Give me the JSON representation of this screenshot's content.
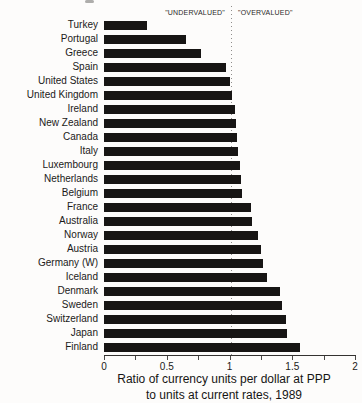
{
  "annotations": {
    "undervalued": "\"UNDERVALUED\"",
    "overvalued": "\"OVERVALUED\""
  },
  "chart_data": {
    "type": "bar",
    "orientation": "horizontal",
    "title": "",
    "categories": [
      "Turkey",
      "Portugal",
      "Greece",
      "Spain",
      "United States",
      "United Kingdom",
      "Ireland",
      "New Zealand",
      "Canada",
      "Italy",
      "Luxembourg",
      "Netherlands",
      "Belgium",
      "France",
      "Australia",
      "Norway",
      "Austria",
      "Germany (W)",
      "Iceland",
      "Denmark",
      "Sweden",
      "Switzerland",
      "Japan",
      "Finland"
    ],
    "values": [
      0.34,
      0.65,
      0.77,
      0.97,
      1.0,
      1.02,
      1.04,
      1.05,
      1.06,
      1.07,
      1.08,
      1.09,
      1.1,
      1.17,
      1.18,
      1.23,
      1.25,
      1.27,
      1.3,
      1.4,
      1.42,
      1.45,
      1.46,
      1.56
    ],
    "xlabel_line1": "Ratio of currency units per dollar at PPP",
    "xlabel_line2": "to units at current rates, 1989",
    "xlim": [
      0,
      2
    ],
    "xticks": [
      {
        "v": 0,
        "label": "0"
      },
      {
        "v": 0.5,
        "label": "0.5"
      },
      {
        "v": 1,
        "label": "1"
      },
      {
        "v": 1.5,
        "label": "1.5"
      },
      {
        "v": 2,
        "label": "2"
      }
    ],
    "minor_ticks": [
      0,
      0.25,
      0.5,
      0.75,
      1,
      1.25,
      1.5,
      1.75,
      2
    ],
    "reference_line": {
      "x": 1.0,
      "style": "dotted",
      "color": "#8f8d8b"
    },
    "bar_color": "#171514",
    "grid": false,
    "legend": false
  }
}
